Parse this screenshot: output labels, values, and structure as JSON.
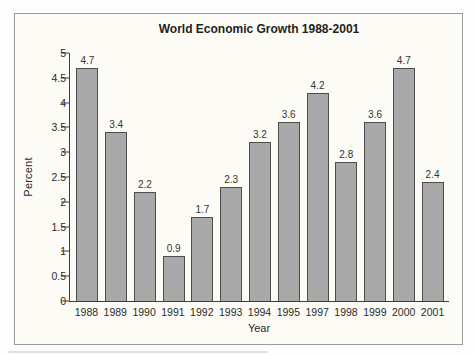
{
  "chart_data": {
    "type": "bar",
    "title": "World Economic Growth 1988-2001",
    "xlabel": "Year",
    "ylabel": "Percent",
    "ylim": [
      0,
      5
    ],
    "yticks": [
      0,
      0.5,
      1,
      1.5,
      2,
      2.5,
      3,
      3.5,
      4,
      4.5,
      5
    ],
    "ytick_labels": [
      "0",
      "0.5",
      "1",
      "1.5",
      "2",
      "2.5",
      "3",
      "3.5",
      "4",
      "4.5",
      "5"
    ],
    "grid": false,
    "legend": null,
    "categories": [
      "1988",
      "1989",
      "1990",
      "1991",
      "1992",
      "1993",
      "1994",
      "1995",
      "1997",
      "1998",
      "1999",
      "2000",
      "2001"
    ],
    "values": [
      4.7,
      3.4,
      2.2,
      0.9,
      1.7,
      2.3,
      3.2,
      3.6,
      4.2,
      2.8,
      3.6,
      4.7,
      2.4
    ],
    "bar_labels": [
      "4.7",
      "3.4",
      "2.2",
      "0.9",
      "1.7",
      "2.3",
      "3.2",
      "3.6",
      "4.2",
      "2.8",
      "3.6",
      "4.7",
      "2.4"
    ],
    "colors": {
      "bar_fill": "#a9a9a9",
      "bar_border": "#4d4d4d",
      "axis": "#3d3d3d",
      "text": "#2a2a2a",
      "frame_border": "#9b9b9b",
      "frame_background": "#fcfbf5"
    }
  }
}
